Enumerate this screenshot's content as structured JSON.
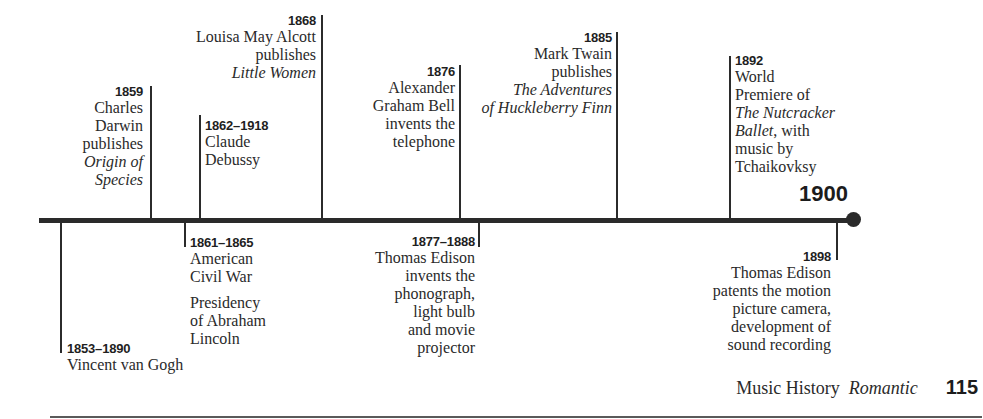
{
  "timeline": {
    "end_label": "1900",
    "colors": {
      "ink": "#2a2a2a",
      "background": "#ffffff"
    }
  },
  "events": {
    "e1859": {
      "date": "1859",
      "lines": [
        "Charles",
        "Darwin",
        "publishes",
        "Origin of",
        "Species"
      ]
    },
    "e1862": {
      "date": "1862–1918",
      "lines": [
        "Claude",
        "Debussy"
      ]
    },
    "e1868": {
      "date": "1868",
      "lines": [
        "Louisa May Alcott",
        "publishes",
        "Little Women"
      ]
    },
    "e1876": {
      "date": "1876",
      "lines": [
        "Alexander",
        "Graham Bell",
        "invents the",
        "telephone"
      ]
    },
    "e1885": {
      "date": "1885",
      "lines": [
        "Mark Twain",
        "publishes",
        "The Adventures",
        "of Huckleberry Finn"
      ]
    },
    "e1892": {
      "date": "1892",
      "lines": [
        "World",
        "Premiere of",
        "The Nutcracker",
        [
          "Ballet",
          ", with"
        ],
        "music by",
        "Tchaikovksy"
      ]
    },
    "e1853": {
      "date": "1853–1890",
      "lines": [
        "Vincent van Gogh"
      ]
    },
    "e1861": {
      "date": "1861–1865",
      "lines": [
        "American",
        "Civil War",
        "Presidency",
        "of Abraham",
        "Lincoln"
      ]
    },
    "e1877": {
      "date": "1877–1888",
      "lines": [
        "Thomas Edison",
        "invents the",
        "phonograph,",
        "light bulb",
        "and movie",
        "projector"
      ]
    },
    "e1898": {
      "date": "1898",
      "lines": [
        "Thomas Edison",
        "patents the motion",
        "picture camera,",
        "development of",
        "sound recording"
      ]
    }
  },
  "footer": {
    "book": "Music History",
    "section": "Romantic",
    "page": "115"
  }
}
